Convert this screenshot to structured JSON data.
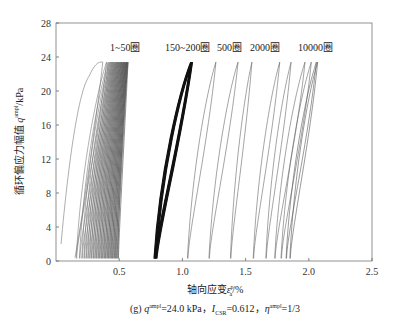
{
  "chart_data": {
    "type": "line",
    "title": "",
    "xlabel": "轴向应变 ε_a^p / %",
    "ylabel": "循环偏应力幅值 q^ampl / kPa",
    "xlim": [
      0,
      2.5
    ],
    "ylim": [
      0,
      28
    ],
    "xticks": [
      0.5,
      1.0,
      1.5,
      2.0,
      2.5
    ],
    "xtick_labels": [
      "0.5",
      "1.0",
      "1.5",
      "2.0",
      "2.5"
    ],
    "yticks": [
      0,
      4,
      8,
      12,
      16,
      20,
      24,
      28
    ],
    "ytick_labels": [
      "0",
      "4",
      "8",
      "12",
      "16",
      "20",
      "24",
      "28"
    ],
    "grid": false,
    "annotations": [
      {
        "text": "1~50圈",
        "x": 0.45,
        "y": 25.0
      },
      {
        "text": "150~200圈",
        "x": 1.0,
        "y": 25.0
      },
      {
        "text": "500圈",
        "x": 1.35,
        "y": 25.0
      },
      {
        "text": "2000圈",
        "x": 1.63,
        "y": 25.0
      },
      {
        "text": "10000圈",
        "x": 2.02,
        "y": 25.0
      }
    ],
    "series": [
      {
        "name": "1~50圈",
        "strain_start_range": [
          0.05,
          0.5
        ],
        "strain_peak_range": [
          0.35,
          0.55
        ],
        "q_peak": 23.4
      },
      {
        "name": "150~200圈",
        "strain_min": 0.78,
        "strain_max": 1.07,
        "q_peak": 23.4
      },
      {
        "name": "500圈",
        "strain_min": 1.04,
        "strain_max": 1.27,
        "q_peak": 23.4
      },
      {
        "name": "2000圈",
        "strain_min": 1.3,
        "strain_max": 1.55,
        "q_peak": 23.4
      },
      {
        "name": "10000圈",
        "strain_min": 1.76,
        "strain_max": 2.07,
        "q_peak": 23.4
      }
    ]
  },
  "labels": {
    "ylabel_main": "循环偏应力幅值 ",
    "ylabel_var": "q",
    "ylabel_sup": "ampl",
    "ylabel_unit": "/kPa",
    "xlabel_main": "轴向应变",
    "xlabel_var": "ε",
    "xlabel_sup": "p",
    "xlabel_sub": "a",
    "xlabel_unit": "/%",
    "caption_prefix": "(g) ",
    "caption_q": "q",
    "caption_q_sup": "ampl",
    "caption_q_val": "=24.0 kPa，",
    "caption_i": "I",
    "caption_i_sub": "CSR",
    "caption_i_val": "=0.612，",
    "caption_eta": "η",
    "caption_eta_sup": "ampl",
    "caption_eta_val": "=1/3"
  }
}
